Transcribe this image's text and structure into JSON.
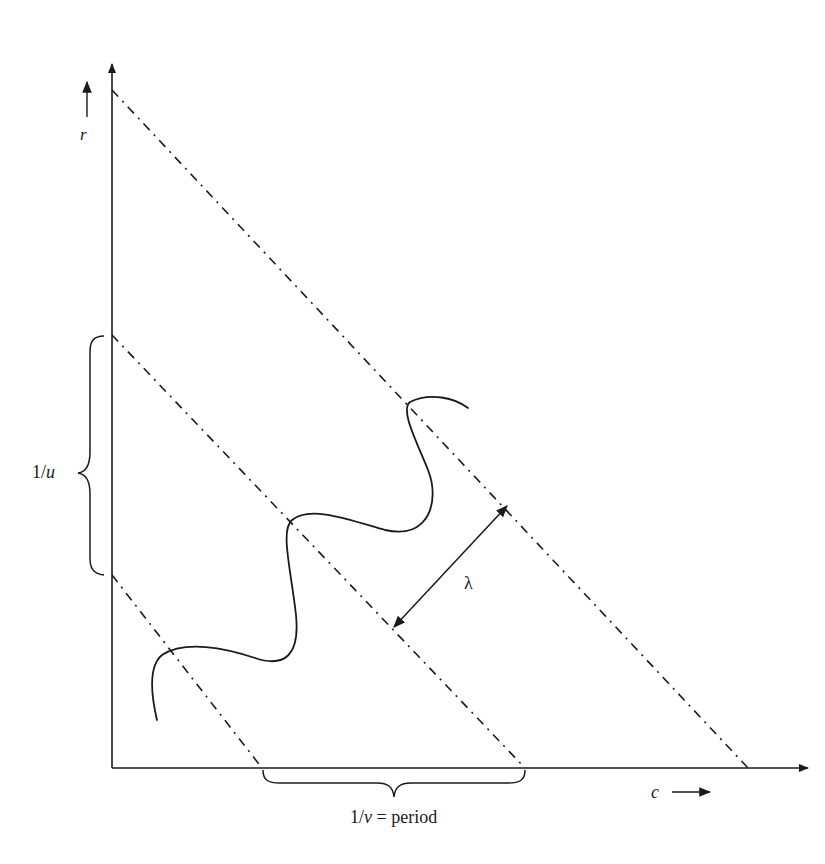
{
  "diagram": {
    "type": "wave-field diagram",
    "axes": {
      "vertical": {
        "label": "r",
        "arrow": "up"
      },
      "horizontal": {
        "label": "c",
        "arrow": "right"
      }
    },
    "labels": {
      "r": "r",
      "c": "c",
      "u_num": "1/",
      "u_var": "u",
      "v_num": "1/",
      "v_var": "v",
      "v_suffix": " = period",
      "lambda": "λ"
    },
    "brackets": {
      "vertical": {
        "label": "1/u",
        "spans": "distance between wavefronts along r axis"
      },
      "horizontal": {
        "label": "1/v = period",
        "spans": "distance between wavefronts along c axis"
      }
    },
    "wavefronts": {
      "count": 3,
      "style": "dash-dot"
    },
    "measure": {
      "label": "λ",
      "style": "double-headed arrow"
    },
    "colors": {
      "ink": "#1a1a1a",
      "background": "#ffffff"
    }
  }
}
